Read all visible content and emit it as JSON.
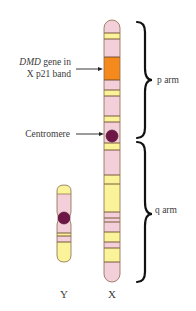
{
  "figure": {
    "type": "chromosome-diagram",
    "colors": {
      "pink": "#f2cfd9",
      "yellow": "#faf39a",
      "orange": "#f38a1b",
      "outline": "#7a5a3a",
      "band_line": "#6b4a2e",
      "centromere": "#6e1646",
      "bracket": "#111111",
      "text": "#3a3a3a"
    }
  },
  "labels": {
    "dmd_gene_line1_italic": "DMD",
    "dmd_gene_line1_rest": " gene in",
    "dmd_gene_line2": "X p21 band",
    "centromere": "Centromere",
    "p_arm": "p arm",
    "q_arm": "q arm",
    "y_chromosome": "Y",
    "x_chromosome": "X"
  },
  "x_chromosome": {
    "bands": [
      {
        "from": 20,
        "to": 33,
        "color": "pink"
      },
      {
        "from": 33,
        "to": 39,
        "color": "yellow"
      },
      {
        "from": 39,
        "to": 57,
        "color": "pink"
      },
      {
        "from": 57,
        "to": 80,
        "color": "orange",
        "name": "p21 (DMD gene)"
      },
      {
        "from": 80,
        "to": 90,
        "color": "pink"
      },
      {
        "from": 90,
        "to": 96,
        "color": "yellow"
      },
      {
        "from": 96,
        "to": 116,
        "color": "pink"
      },
      {
        "from": 116,
        "to": 122,
        "color": "yellow"
      },
      {
        "from": 122,
        "to": 143,
        "color": "pink"
      },
      {
        "from": 143,
        "to": 150,
        "color": "yellow"
      },
      {
        "from": 150,
        "to": 175,
        "color": "pink"
      },
      {
        "from": 175,
        "to": 184,
        "color": "yellow"
      },
      {
        "from": 184,
        "to": 212,
        "color": "yellow"
      },
      {
        "from": 212,
        "to": 218,
        "color": "pink"
      },
      {
        "from": 218,
        "to": 222,
        "color": "pink"
      },
      {
        "from": 222,
        "to": 232,
        "color": "pink"
      },
      {
        "from": 232,
        "to": 242,
        "color": "yellow"
      },
      {
        "from": 242,
        "to": 248,
        "color": "pink"
      },
      {
        "from": 248,
        "to": 262,
        "color": "yellow"
      },
      {
        "from": 262,
        "to": 282,
        "color": "pink"
      }
    ],
    "centromere_y": 136
  },
  "y_chromosome": {
    "centromere_y": 218
  }
}
